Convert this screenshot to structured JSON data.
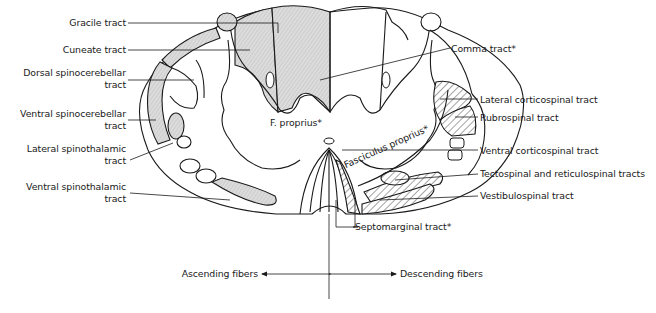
{
  "figure": {
    "left_labels": [
      {
        "id": "gracile",
        "text": "Gracile tract"
      },
      {
        "id": "cuneate",
        "text": "Cuneate tract"
      },
      {
        "id": "dorsal_spinocerebellar_1",
        "text": "Dorsal spinocerebellar"
      },
      {
        "id": "dorsal_spinocerebellar_2",
        "text": "tract"
      },
      {
        "id": "ventral_spinocerebellar_1",
        "text": "Ventral spinocerebellar"
      },
      {
        "id": "ventral_spinocerebellar_2",
        "text": "tract"
      },
      {
        "id": "lateral_spinothalamic_1",
        "text": "Lateral spinothalamic"
      },
      {
        "id": "lateral_spinothalamic_2",
        "text": "tract"
      },
      {
        "id": "ventral_spinothalamic_1",
        "text": "Ventral spinothalamic"
      },
      {
        "id": "ventral_spinothalamic_2",
        "text": "tract"
      }
    ],
    "right_labels": [
      {
        "id": "comma",
        "text": "Comma tract*"
      },
      {
        "id": "lateral_corticospinal",
        "text": "Lateral corticospinal tract"
      },
      {
        "id": "rubrospinal",
        "text": "Rubrospinal tract"
      },
      {
        "id": "ventral_corticospinal",
        "text": "Ventral corticospinal tract"
      },
      {
        "id": "tectospinal",
        "text": "Tectospinal and reticulospinal tracts"
      },
      {
        "id": "vestibulospinal",
        "text": "Vestibulospinal tract"
      },
      {
        "id": "septomarginal",
        "text": "Septomarginal tract*"
      }
    ],
    "inner_labels": {
      "f_proprius": "F. proprius*",
      "fasciculus_proprius": "Fasciculus proprius*"
    },
    "legend": {
      "ascending": "Ascending fibers",
      "descending": "Descending fibers"
    },
    "colors": {
      "line": "#1a1a1a",
      "ascending_fill": "#d4d4d4",
      "background": "#ffffff"
    }
  }
}
